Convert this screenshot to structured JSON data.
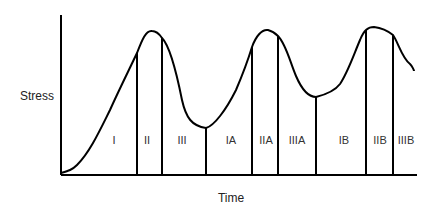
{
  "diagram": {
    "ylabel": "Stress",
    "xlabel": "Time",
    "colors": {
      "line": "#000000",
      "text": "#333333",
      "background": "#ffffff"
    },
    "phases": [
      {
        "label": "I",
        "x": 114
      },
      {
        "label": "II",
        "x": 147
      },
      {
        "label": "III",
        "x": 182
      },
      {
        "label": "IA",
        "x": 231
      },
      {
        "label": "IIA",
        "x": 266
      },
      {
        "label": "IIIA",
        "x": 297
      },
      {
        "label": "IB",
        "x": 344
      },
      {
        "label": "IIB",
        "x": 380
      },
      {
        "label": "IIIB",
        "x": 406
      }
    ],
    "dividers": [
      137,
      162,
      206,
      252,
      278,
      316,
      366,
      393
    ]
  }
}
